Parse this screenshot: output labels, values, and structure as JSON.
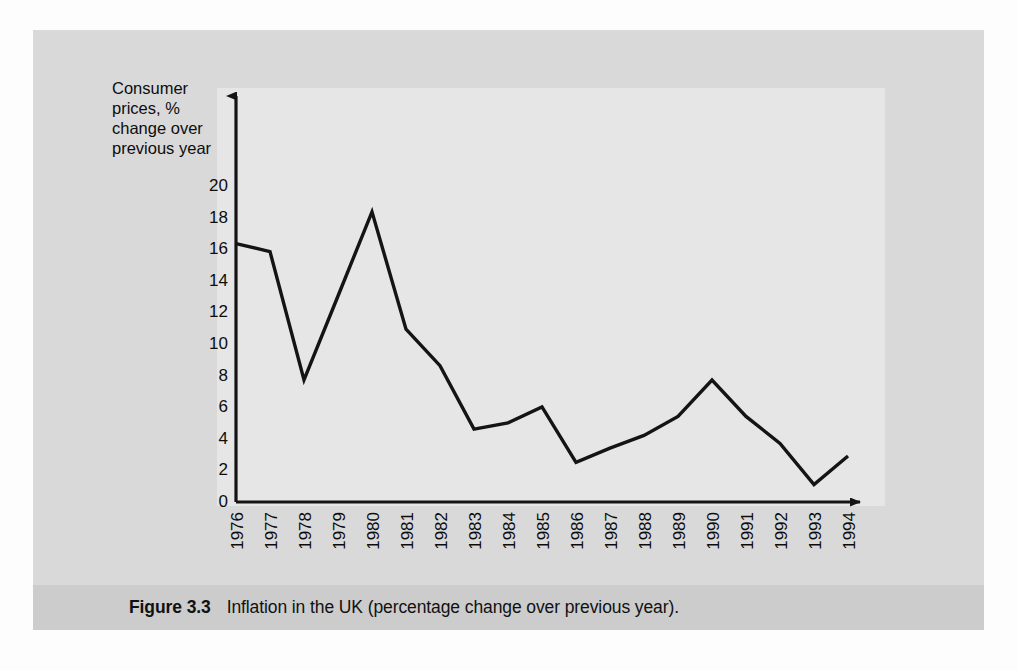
{
  "figure": {
    "caption_label": "Figure 3.3",
    "caption_text": "Inflation in the UK (percentage change over previous year).",
    "panel_color": "#d9d9d9",
    "plot_background_color": "#e6e6e6",
    "caption_band_color": "#cccccc",
    "line_color": "#141414"
  },
  "chart_data": {
    "type": "line",
    "title": "",
    "subtitle": "",
    "xlabel": "",
    "ylabel": "Consumer prices, % change over previous year",
    "ylabel_lines": [
      "Consumer",
      "prices, %",
      "change over",
      "previous year"
    ],
    "categories": [
      "1976",
      "1977",
      "1978",
      "1979",
      "1980",
      "1981",
      "1982",
      "1983",
      "1984",
      "1985",
      "1986",
      "1987",
      "1988",
      "1989",
      "1990",
      "1991",
      "1992",
      "1993",
      "1994"
    ],
    "values": [
      16.3,
      15.8,
      7.7,
      13.0,
      18.3,
      10.9,
      8.6,
      4.6,
      5.0,
      6.0,
      2.5,
      3.4,
      4.2,
      5.4,
      7.7,
      5.4,
      3.7,
      1.1,
      2.9
    ],
    "series": [
      {
        "name": "Consumer prices, % change over previous year",
        "values": [
          16.3,
          15.8,
          7.7,
          13.0,
          18.3,
          10.9,
          8.6,
          4.6,
          5.0,
          6.0,
          2.5,
          3.4,
          4.2,
          5.4,
          7.7,
          5.4,
          3.7,
          1.1,
          2.9
        ]
      }
    ],
    "ytick_labels": [
      "0",
      "2",
      "4",
      "6",
      "8",
      "10",
      "12",
      "14",
      "16",
      "18",
      "20"
    ],
    "yticks": [
      0,
      2,
      4,
      6,
      8,
      10,
      12,
      14,
      16,
      18,
      20
    ],
    "ylim": [
      0,
      20
    ],
    "grid": false,
    "legend": false,
    "legend_position": "none",
    "x_axis_arrow": true,
    "y_axis_arrow": true
  }
}
